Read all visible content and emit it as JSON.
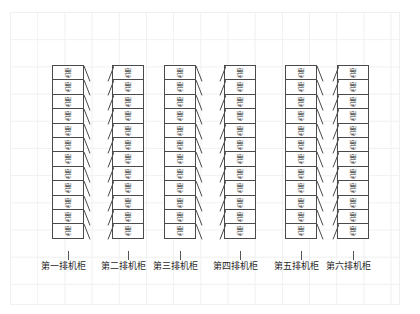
{
  "canvas": {
    "width": 420,
    "height": 314,
    "background_color": "#ffffff"
  },
  "grid": {
    "name": "background-grid",
    "line_color": "#f0f0f2",
    "cell_size": 27.2,
    "origin_x": 10,
    "origin_y": 12,
    "width": 390,
    "height": 293
  },
  "diagram": {
    "type": "data-center-rack-layout",
    "unit_label": "机柜",
    "units_per_row": 12,
    "row_count": 6,
    "unit_width": 32,
    "unit_height": 15.4,
    "unit_border_color": "#4a4a4a",
    "unit_fill_color": "#ffffff",
    "text_color": "#2b2b2b",
    "top_y": 65,
    "rows": [
      {
        "id": "row-1",
        "caption": "第一排机柜",
        "x": 52,
        "depth_side": "right",
        "caption_x": 41,
        "units": 12
      },
      {
        "id": "row-2",
        "caption": "第二排机柜",
        "x": 112,
        "depth_side": "left",
        "caption_x": 101,
        "units": 12
      },
      {
        "id": "row-3",
        "caption": "第三排机柜",
        "x": 164,
        "depth_side": "right",
        "caption_x": 153,
        "units": 12
      },
      {
        "id": "row-4",
        "caption": "第四排机柜",
        "x": 224,
        "depth_side": "left",
        "caption_x": 213,
        "units": 12
      },
      {
        "id": "row-5",
        "caption": "第五排机柜",
        "x": 285,
        "depth_side": "right",
        "caption_x": 274,
        "units": 12
      },
      {
        "id": "row-6",
        "caption": "第六排机柜",
        "x": 337,
        "depth_side": "left",
        "caption_x": 326,
        "units": 12
      }
    ],
    "leader": {
      "color": "#555555",
      "top_y": 251,
      "height": 9
    },
    "caption_y": 261,
    "caption_font_size": 9
  }
}
